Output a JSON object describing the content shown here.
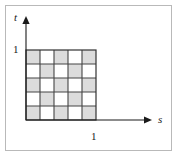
{
  "figure": {
    "kind": "coordinate-diagram",
    "border_color": "#b9b9b9",
    "background": "#ffffff"
  },
  "axes": {
    "horizontal": {
      "label": "s",
      "tick_label": "1",
      "arrow": "arrow-right",
      "color": "#1a1a1a",
      "start_x": 26,
      "end_x": 152,
      "y": 120
    },
    "vertical": {
      "label": "t",
      "tick_label": "1",
      "arrow": "arrow-up",
      "color": "#1a1a1a",
      "x": 26,
      "start_y": 120,
      "end_y": 16
    }
  },
  "chart_data": {
    "type": "heatmap",
    "title": "",
    "xlabel": "s",
    "ylabel": "t",
    "xlim": [
      0,
      1
    ],
    "ylim": [
      0,
      1
    ],
    "xticks": [
      1
    ],
    "yticks": [
      1
    ],
    "xtick_labels": [
      "1"
    ],
    "ytick_labels": [
      "1"
    ],
    "grid": true,
    "rows": 5,
    "cols": 5,
    "cell_colors": {
      "filled": "#dcdcdc",
      "empty": "#ffffff",
      "line": "#444444",
      "outline": "#333333"
    },
    "pattern_note": "checkerboard, shaded where (row + col) is even, rows indexed from top",
    "values": [
      [
        1,
        0,
        1,
        0,
        1
      ],
      [
        0,
        1,
        0,
        1,
        0
      ],
      [
        1,
        0,
        1,
        0,
        1
      ],
      [
        0,
        1,
        0,
        1,
        0
      ],
      [
        1,
        0,
        1,
        0,
        1
      ]
    ],
    "grid_box": {
      "x": 26,
      "y": 50,
      "width": 70,
      "height": 70
    }
  }
}
